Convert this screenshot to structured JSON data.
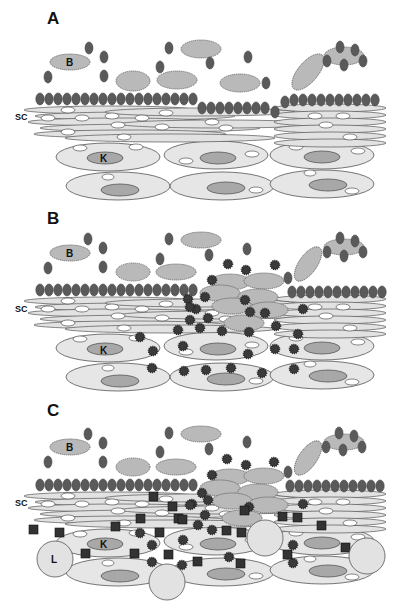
{
  "figure": {
    "panels": [
      {
        "id": "A",
        "label": "A",
        "layer_label": "SC",
        "bacterium_label": "B",
        "keratinocyte_label": "K",
        "state": "intact barrier"
      },
      {
        "id": "B",
        "label": "B",
        "layer_label": "SC",
        "bacterium_label": "B",
        "keratinocyte_label": "K",
        "state": "barrier breach with toxin penetration"
      },
      {
        "id": "C",
        "label": "C",
        "layer_label": "SC",
        "bacterium_label": "B",
        "keratinocyte_label": "K",
        "lymphocyte_label": "L",
        "state": "immune cell infiltration"
      }
    ]
  },
  "colors": {
    "background": "#ffffff",
    "cell_fill": "#e6e6e6",
    "nucleus_fill": "#a8a8a8",
    "bacteria_fill": "#5a5a5a",
    "toxin_fill": "#3a3a3a",
    "outline": "#555555"
  }
}
